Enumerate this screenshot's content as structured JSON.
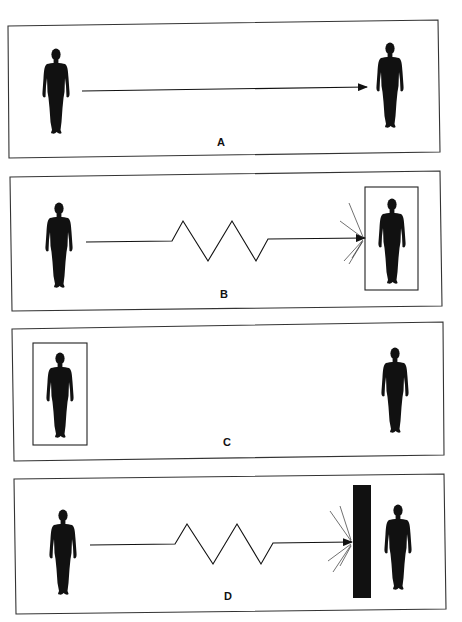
{
  "figure": {
    "panels": [
      {
        "id": "A",
        "label": "A",
        "description": "Sender on left, straight arrow to receiver on right"
      },
      {
        "id": "B",
        "label": "B",
        "description": "Zigzag (disrupted) message arrow hits a boxed receiver, bursting"
      },
      {
        "id": "C",
        "label": "C",
        "description": "Sender boxed in on the left, no message, receiver on right"
      },
      {
        "id": "D",
        "label": "D",
        "description": "Zigzag message arrow blocked by a solid wall before the receiver"
      }
    ]
  },
  "colors": {
    "ink": "#111111",
    "frame": "#333333",
    "background": "#ffffff"
  }
}
